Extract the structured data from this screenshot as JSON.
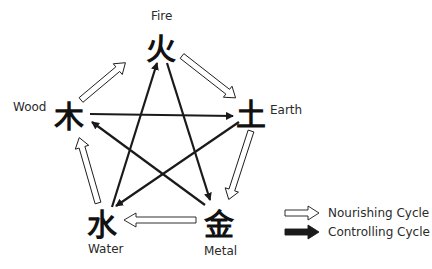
{
  "diagram": {
    "elements": [
      {
        "id": "fire",
        "label": "Fire",
        "char": "火"
      },
      {
        "id": "earth",
        "label": "Earth",
        "char": "土"
      },
      {
        "id": "metal",
        "label": "Metal",
        "char": "金"
      },
      {
        "id": "water",
        "label": "Water",
        "char": "水"
      },
      {
        "id": "wood",
        "label": "Wood",
        "char": "木"
      }
    ],
    "nourishing_cycle": [
      {
        "from": "Wood",
        "to": "Fire"
      },
      {
        "from": "Fire",
        "to": "Earth"
      },
      {
        "from": "Earth",
        "to": "Metal"
      },
      {
        "from": "Metal",
        "to": "Water"
      },
      {
        "from": "Water",
        "to": "Wood"
      }
    ],
    "controlling_cycle": [
      {
        "from": "Wood",
        "to": "Earth"
      },
      {
        "from": "Earth",
        "to": "Water"
      },
      {
        "from": "Water",
        "to": "Fire"
      },
      {
        "from": "Fire",
        "to": "Metal"
      },
      {
        "from": "Metal",
        "to": "Wood"
      }
    ],
    "legend": {
      "nourishing": "Nourishing Cycle",
      "controlling": "Controlling Cycle"
    },
    "colors": {
      "outline_arrow": "#ffffff",
      "stroke": "#1a1a1a",
      "filled_arrow": "#1a1a1a"
    }
  }
}
